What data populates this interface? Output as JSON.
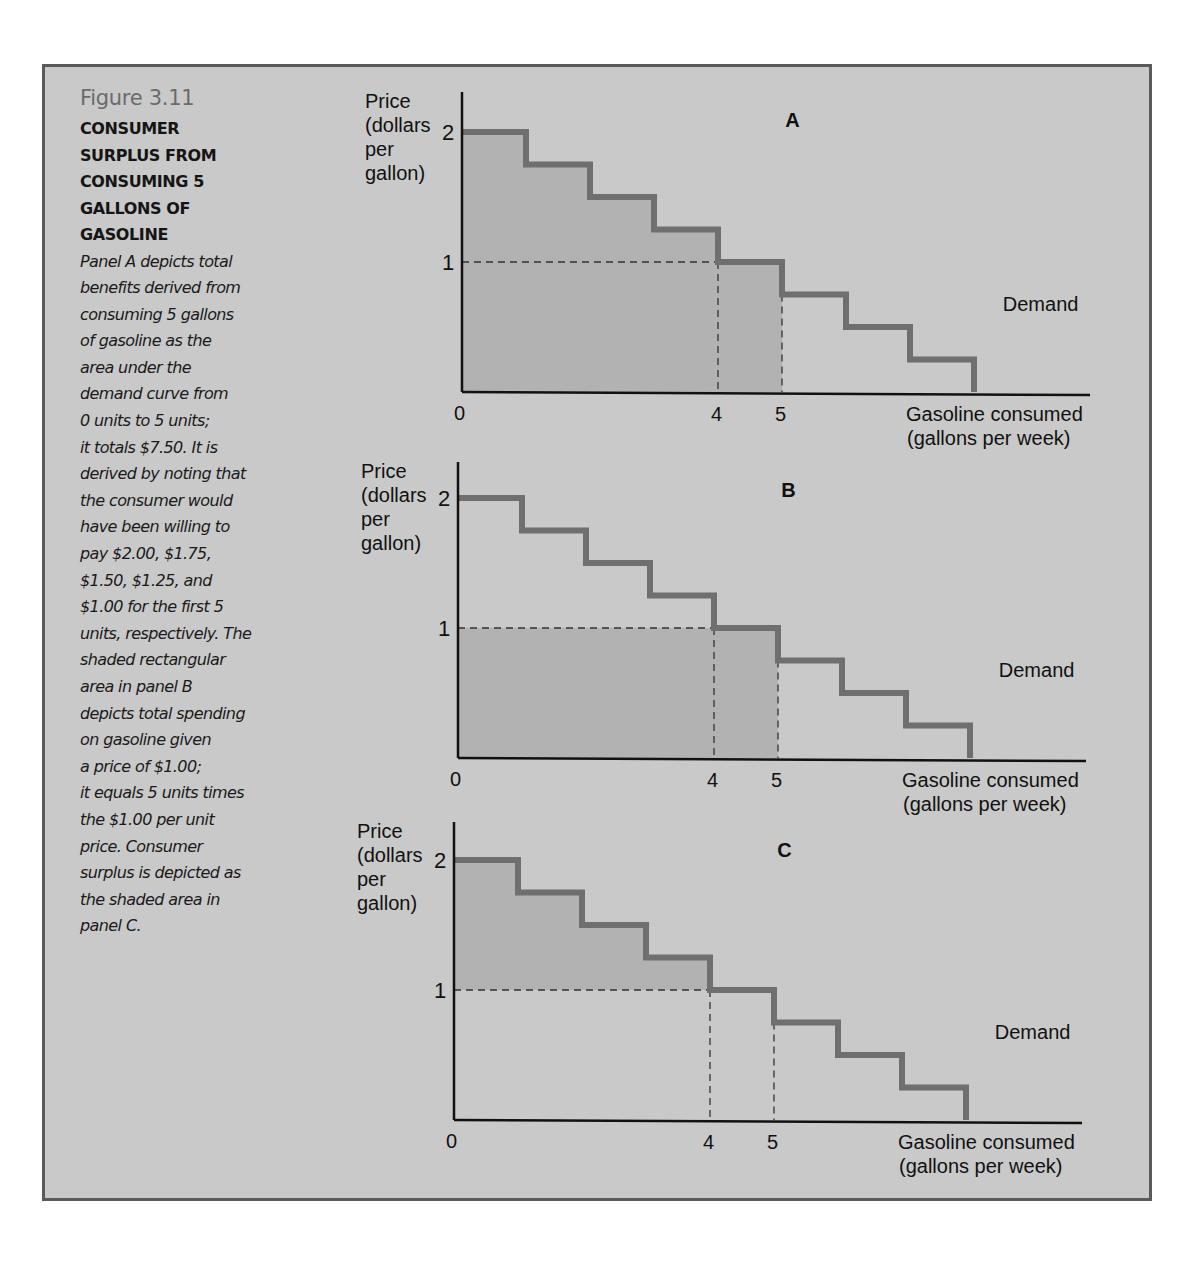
{
  "figure": {
    "number": "Figure 3.11",
    "title": "CONSUMER\nSURPLUS FROM\nCONSUMING 5\nGALLONS OF\nGASOLINE",
    "body": "Panel A depicts total\nbenefits derived from\nconsuming 5 gallons\nof gasoline as the\narea under the\ndemand curve from\n0 units to 5 units;\nit totals $7.50. It is\nderived by noting that\nthe consumer would\nhave been willing to\npay $2.00, $1.75,\n$1.50, $1.25, and\n$1.00 for the first 5\nunits, respectively. The\nshaded rectangular\narea in panel B\ndepicts total spending\non gasoline given\na price of $1.00;\nit equals 5 units times\nthe $1.00 per unit\nprice. Consumer\nsurplus is depicted as\nthe shaded area in\npanel C."
  },
  "colors": {
    "background": "#c9c9c9",
    "shade": "#b2b2b2",
    "demand_line": "#6f6f6f",
    "axis": "#111111",
    "border": "#5a5a5a"
  },
  "chart_data": [
    {
      "type": "line",
      "panel": "A",
      "title": "A",
      "ylabel": "Price (dollars per gallon)",
      "xlabel": "Gasoline consumed (gallons per week)",
      "series_label": "Demand",
      "step": true,
      "x": [
        0,
        1,
        2,
        3,
        4,
        5,
        6,
        7,
        8
      ],
      "values": [
        2.0,
        1.75,
        1.5,
        1.25,
        1.0,
        0.75,
        0.5,
        0.25
      ],
      "yticks": [
        1,
        2
      ],
      "xticks": [
        0,
        4,
        5
      ],
      "reference_price": 1,
      "reference_quantity": [
        4,
        5
      ],
      "shaded": "area under demand from 0 to 5 units",
      "shaded_value": 7.5,
      "xlim": [
        0,
        9.8
      ],
      "ylim": [
        0,
        2.3
      ]
    },
    {
      "type": "line",
      "panel": "B",
      "title": "B",
      "ylabel": "Price (dollars per gallon)",
      "xlabel": "Gasoline consumed (gallons per week)",
      "series_label": "Demand",
      "step": true,
      "x": [
        0,
        1,
        2,
        3,
        4,
        5,
        6,
        7,
        8
      ],
      "values": [
        2.0,
        1.75,
        1.5,
        1.25,
        1.0,
        0.75,
        0.5,
        0.25
      ],
      "yticks": [
        1,
        2
      ],
      "xticks": [
        0,
        4,
        5
      ],
      "reference_price": 1,
      "reference_quantity": [
        4,
        5
      ],
      "shaded": "rectangle 0-5 units at price $1.00 (total spending)",
      "shaded_value": 5.0,
      "xlim": [
        0,
        9.8
      ],
      "ylim": [
        0,
        2.3
      ]
    },
    {
      "type": "line",
      "panel": "C",
      "title": "C",
      "ylabel": "Price (dollars per gallon)",
      "xlabel": "Gasoline consumed (gallons per week)",
      "series_label": "Demand",
      "step": true,
      "x": [
        0,
        1,
        2,
        3,
        4,
        5,
        6,
        7,
        8
      ],
      "values": [
        2.0,
        1.75,
        1.5,
        1.25,
        1.0,
        0.75,
        0.5,
        0.25
      ],
      "yticks": [
        1,
        2
      ],
      "xticks": [
        0,
        4,
        5
      ],
      "reference_price": 1,
      "reference_quantity": [
        4,
        5
      ],
      "shaded": "area between demand and price $1.00 from 0 to 4 units (consumer surplus)",
      "shaded_value": 2.5,
      "xlim": [
        0,
        9.8
      ],
      "ylim": [
        0,
        2.3
      ]
    }
  ],
  "panels": [
    {
      "label": "A",
      "ylabel_lines": [
        "Price",
        "(dollars",
        "per",
        "gallon)"
      ],
      "xlabel_lines": [
        "Gasoline consumed",
        "(gallons per week)"
      ],
      "demand_label": "Demand",
      "tick_y1": "1",
      "tick_y2": "2",
      "tick_x0": "0",
      "tick_x4": "4",
      "tick_x5": "5"
    },
    {
      "label": "B",
      "ylabel_lines": [
        "Price",
        "(dollars",
        "per",
        "gallon)"
      ],
      "xlabel_lines": [
        "Gasoline consumed",
        "(gallons per week)"
      ],
      "demand_label": "Demand",
      "tick_y1": "1",
      "tick_y2": "2",
      "tick_x0": "0",
      "tick_x4": "4",
      "tick_x5": "5"
    },
    {
      "label": "C",
      "ylabel_lines": [
        "Price",
        "(dollars",
        "per",
        "gallon)"
      ],
      "xlabel_lines": [
        "Gasoline consumed",
        "(gallons per week)"
      ],
      "demand_label": "Demand",
      "tick_y1": "1",
      "tick_y2": "2",
      "tick_x0": "0",
      "tick_x4": "4",
      "tick_x5": "5"
    }
  ]
}
